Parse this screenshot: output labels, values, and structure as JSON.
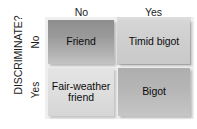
{
  "diagram": {
    "type": "2x2-matrix",
    "axis_title_vertical": "DISCRIMINATE?",
    "column_axis_labels": [
      "No",
      "Yes"
    ],
    "row_axis_labels": [
      "No",
      "Yes"
    ],
    "cells": [
      {
        "row": "No",
        "column": "No",
        "label": "Friend",
        "fill": "#9a9a9a"
      },
      {
        "row": "No",
        "column": "Yes",
        "label": "Timid bigot",
        "fill": "#cfcfcf"
      },
      {
        "row": "Yes",
        "column": "No",
        "label": "Fair-weather friend",
        "fill": "#dedede"
      },
      {
        "row": "Yes",
        "column": "Yes",
        "label": "Bigot",
        "fill": "#b6b6b6"
      }
    ],
    "colors": {
      "background": "#ffffff",
      "text": "#1b1b1b",
      "highlight_plate": "#d2d2d2"
    }
  }
}
